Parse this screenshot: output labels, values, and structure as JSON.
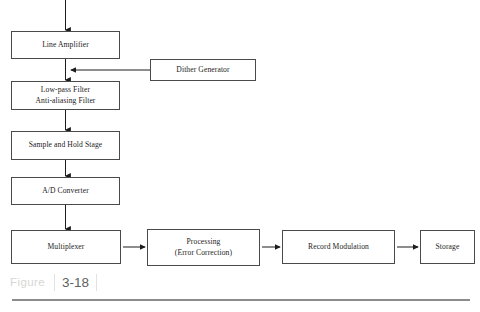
{
  "figure": {
    "label": "Figure",
    "number": "3-18",
    "type": "block-diagram",
    "title": "",
    "nodes": [
      {
        "id": "line-amplifier",
        "lines": [
          "Line Amplifier"
        ]
      },
      {
        "id": "dither-generator",
        "lines": [
          "Dither Generator"
        ]
      },
      {
        "id": "lowpass-filter",
        "lines": [
          "Low-pass Filter",
          "Anti-aliasing Filter"
        ]
      },
      {
        "id": "sample-and-hold",
        "lines": [
          "Sample and Hold Stage"
        ]
      },
      {
        "id": "ad-converter",
        "lines": [
          "A/D Converter"
        ]
      },
      {
        "id": "multiplexer",
        "lines": [
          "Multiplexer"
        ]
      },
      {
        "id": "processing",
        "lines": [
          "Processing",
          "(Error Correction)"
        ]
      },
      {
        "id": "record-modulation",
        "lines": [
          "Record Modulation"
        ]
      },
      {
        "id": "storage",
        "lines": [
          "Storage"
        ]
      }
    ],
    "flow": [
      "input -> Line Amplifier",
      "Line Amplifier -> Low-pass Filter / Anti-aliasing Filter",
      "Dither Generator -> Low-pass Filter / Anti-aliasing Filter",
      "Low-pass Filter / Anti-aliasing Filter -> Sample and Hold Stage",
      "Sample and Hold Stage -> A/D Converter",
      "A/D Converter -> Multiplexer",
      "Multiplexer -> Processing (Error Correction)",
      "Processing (Error Correction) -> Record Modulation",
      "Record Modulation -> Storage"
    ],
    "colors": {
      "box_border": "#4a4a4a",
      "connector": "#1c1c1c",
      "caption_word": "#d6d6d6",
      "caption_number": "#5f5f5f",
      "rule": "#8c8c8c",
      "background": "#ffffff"
    }
  }
}
